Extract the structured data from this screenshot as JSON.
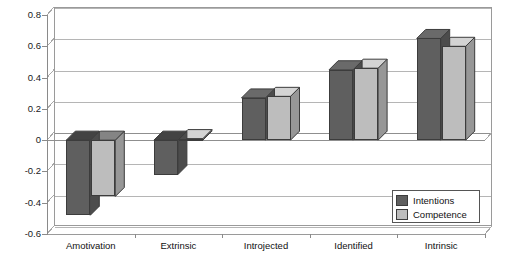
{
  "chart_data": {
    "type": "bar",
    "title": "",
    "subtitle": "",
    "xlabel": "",
    "ylabel": "",
    "categories": [
      "Amotivation",
      "Extrinsic",
      "Introjected",
      "Identified",
      "Intrinsic"
    ],
    "series": [
      {
        "name": "Intentions",
        "color": "#5f5f5f",
        "values": [
          -0.48,
          -0.22,
          0.27,
          0.45,
          0.65
        ]
      },
      {
        "name": "Competence",
        "color": "#bdbdbd",
        "values": [
          -0.36,
          0.01,
          0.28,
          0.46,
          0.6
        ]
      }
    ],
    "ylim": [
      -0.6,
      0.8
    ],
    "yticks": [
      0.8,
      0.6,
      0.4,
      0.2,
      0,
      -0.2,
      -0.4,
      -0.6
    ],
    "ytick_labels": [
      "0.8",
      "0.6",
      "0.4",
      "0.2",
      "0",
      "-0.2",
      "-0.4",
      "-0.6"
    ],
    "grid": true,
    "grid_axis": "y",
    "legend_position": "inside-bottom-right",
    "style": "3d-perspective",
    "background": "#ffffff",
    "axis_color": "#8a8a8a",
    "grid_color": "#b5b5b5"
  },
  "legend": {
    "entries": [
      {
        "label": "Intentions",
        "color": "#5f5f5f"
      },
      {
        "label": "Competence",
        "color": "#bdbdbd"
      }
    ]
  }
}
